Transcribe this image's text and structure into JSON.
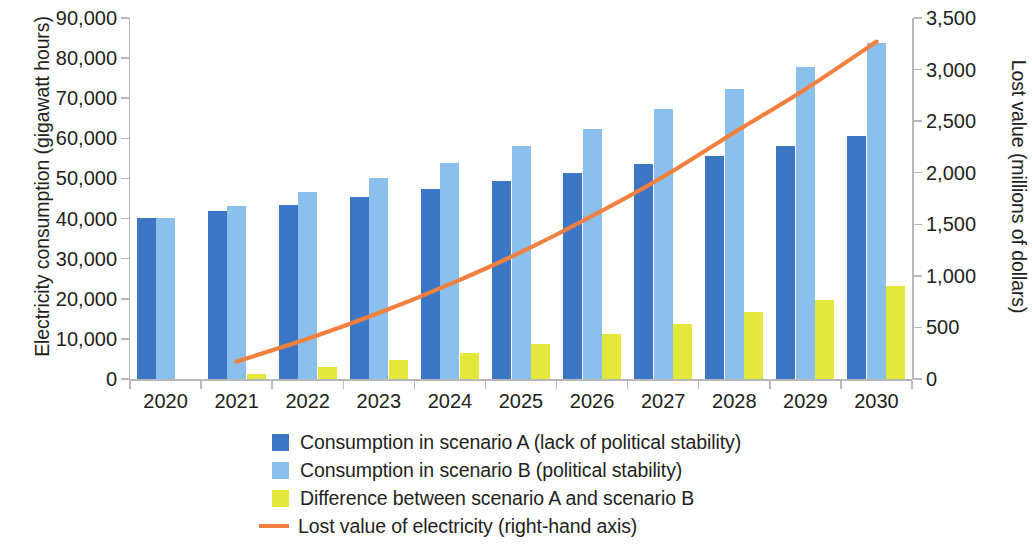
{
  "chart_data": {
    "type": "bar",
    "title": "",
    "subtitle": "",
    "xlabel": "",
    "ylabel": "Electricity consumption (gigawatt hours)",
    "y2label": "Lost value (millions of dollars)",
    "categories": [
      "2020",
      "2021",
      "2022",
      "2023",
      "2024",
      "2025",
      "2026",
      "2027",
      "2028",
      "2029",
      "2030"
    ],
    "ylim": [
      0,
      90000
    ],
    "y2lim": [
      0,
      3500
    ],
    "yticks": [
      "0",
      "10,000",
      "20,000",
      "30,000",
      "40,000",
      "50,000",
      "60,000",
      "70,000",
      "80,000",
      "90,000"
    ],
    "ytick_values": [
      0,
      10000,
      20000,
      30000,
      40000,
      50000,
      60000,
      70000,
      80000,
      90000
    ],
    "y2ticks": [
      "0",
      "500",
      "1,000",
      "1,500",
      "2,000",
      "2,500",
      "3,000",
      "3,500"
    ],
    "y2tick_values": [
      0,
      500,
      1000,
      1500,
      2000,
      2500,
      3000,
      3500
    ],
    "grid": false,
    "legend_position": "bottom",
    "series": [
      {
        "name": "Consumption in scenario A (lack of political stability)",
        "kind": "bar",
        "color": "#3d76c4",
        "axis": "left",
        "values": [
          40200,
          41800,
          43500,
          45400,
          47300,
          49300,
          51300,
          53500,
          55700,
          58000,
          60600
        ]
      },
      {
        "name": "Consumption in scenario B (political stability)",
        "kind": "bar",
        "color": "#8cc0ec",
        "axis": "left",
        "values": [
          40200,
          43100,
          46500,
          50100,
          53900,
          58000,
          62400,
          67200,
          72300,
          77800,
          83700
        ]
      },
      {
        "name": "Difference between scenario A and scenario B",
        "kind": "bar",
        "color": "#e3e83a",
        "axis": "left",
        "values": [
          0,
          1300,
          3000,
          4700,
          6600,
          8700,
          11100,
          13700,
          16600,
          19800,
          23100
        ]
      },
      {
        "name": "Lost value of electricity (right-hand axis)",
        "kind": "line",
        "color": "#f2813f",
        "axis": "right",
        "x": [
          "2021",
          "2022",
          "2023",
          "2024",
          "2025",
          "2026",
          "2027",
          "2028",
          "2029",
          "2030"
        ],
        "values": [
          170,
          390,
          640,
          920,
          1230,
          1580,
          1960,
          2390,
          2810,
          3270
        ]
      }
    ]
  },
  "legend": {
    "items": [
      {
        "label": "Consumption in scenario A (lack of political stability)",
        "color": "#3d76c4",
        "marker": "square"
      },
      {
        "label": "Consumption in scenario B (political stability)",
        "color": "#8cc0ec",
        "marker": "square"
      },
      {
        "label": "Difference between scenario A and scenario B",
        "color": "#e3e83a",
        "marker": "square"
      },
      {
        "label": "Lost value of electricity (right-hand axis)",
        "color": "#f2813f",
        "marker": "line"
      }
    ]
  },
  "colors": {
    "scenario_a": "#3d76c4",
    "scenario_b": "#8cc0ec",
    "difference": "#e3e83a",
    "lost_value_line": "#f2813f",
    "axis": "#b8b8b8",
    "text": "#231f20",
    "background": "#ffffff"
  }
}
